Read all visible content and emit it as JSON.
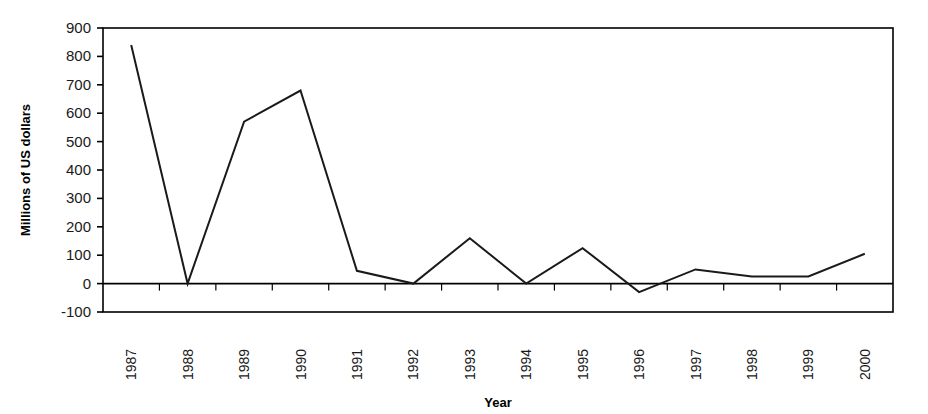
{
  "chart_data": {
    "type": "line",
    "title": "",
    "xlabel": "Year",
    "ylabel": "Millions of US dollars",
    "categories": [
      "1987",
      "1988",
      "1989",
      "1990",
      "1991",
      "1992",
      "1993",
      "1994",
      "1995",
      "1996",
      "1997",
      "1998",
      "1999",
      "2000"
    ],
    "values": [
      840,
      0,
      570,
      680,
      45,
      0,
      160,
      0,
      125,
      -30,
      50,
      25,
      25,
      105
    ],
    "series": [
      {
        "name": "",
        "values": [
          840,
          0,
          570,
          680,
          45,
          0,
          160,
          0,
          125,
          -30,
          50,
          25,
          25,
          105
        ]
      }
    ],
    "ylim": [
      -100,
      900
    ],
    "ytick_labels": [
      "900",
      "800",
      "700",
      "600",
      "500",
      "400",
      "300",
      "200",
      "100",
      "0",
      "-100"
    ],
    "ytick_values": [
      900,
      800,
      700,
      600,
      500,
      400,
      300,
      200,
      100,
      0,
      -100
    ],
    "grid": false,
    "legend": "none",
    "line_color": "#1a1a1a",
    "axis_color": "#000000",
    "plot_background": "#ffffff",
    "category_label_rotation": -90,
    "zero_line": true
  }
}
